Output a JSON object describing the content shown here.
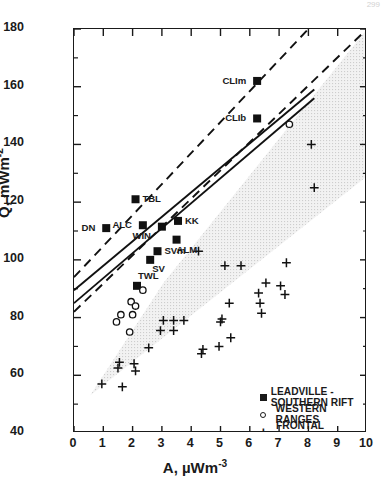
{
  "page": {
    "running_head": "",
    "page_number": "299"
  },
  "chart_data": {
    "type": "scatter",
    "title": "",
    "xlabel": "A, µWm-3",
    "ylabel": "Q, mWm-2",
    "xlabel_base": "A, µWm",
    "xlabel_exp": "-3",
    "ylabel_base": "Q, mWm",
    "ylabel_exp": "-2",
    "xlim": [
      0,
      10
    ],
    "ylim": [
      40,
      180
    ],
    "xticks": [
      0,
      1,
      2,
      3,
      4,
      5,
      6,
      7,
      8,
      9,
      10
    ],
    "yticks": [
      40,
      60,
      80,
      100,
      120,
      140,
      160,
      180
    ],
    "grid": false,
    "legend_position": "lower-right-inside",
    "legend": [
      {
        "marker": "filled-square",
        "label": "LEADVILLE - SOUTHERN RIFT"
      },
      {
        "marker": "open-circle",
        "label": "WESTERN RANGES"
      },
      {
        "marker": "plus",
        "label": "FRONTAL RANGES"
      }
    ],
    "series": [
      {
        "name": "LEADVILLE - SOUTHERN RIFT",
        "marker": "filled-square",
        "points": [
          {
            "x": 1.1,
            "y": 111.0,
            "label": "DN",
            "label_pos": "left"
          },
          {
            "x": 2.1,
            "y": 121.0,
            "label": "TBL",
            "label_pos": "right"
          },
          {
            "x": 2.35,
            "y": 112.0,
            "label": "ALC",
            "label_pos": "left"
          },
          {
            "x": 3.0,
            "y": 111.5,
            "label": "WIN",
            "label_pos": "below-left"
          },
          {
            "x": 3.55,
            "y": 113.5,
            "label": "KK",
            "label_pos": "right"
          },
          {
            "x": 3.5,
            "y": 107.0,
            "label": "ALM",
            "label_pos": "below"
          },
          {
            "x": 2.85,
            "y": 103.0,
            "label": "SVm",
            "label_pos": "right"
          },
          {
            "x": 2.6,
            "y": 100.0,
            "label": "SV",
            "label_pos": "below-right"
          },
          {
            "x": 2.15,
            "y": 91.0,
            "label": "TWL",
            "label_pos": "above-right"
          },
          {
            "x": 6.25,
            "y": 162.0,
            "label": "CLIm",
            "label_pos": "left"
          },
          {
            "x": 6.25,
            "y": 149.0,
            "label": "CLIb",
            "label_pos": "left"
          }
        ]
      },
      {
        "name": "WESTERN RANGES",
        "marker": "open-circle",
        "points": [
          {
            "x": 7.35,
            "y": 147.0
          },
          {
            "x": 2.35,
            "y": 89.5
          },
          {
            "x": 1.95,
            "y": 85.5
          },
          {
            "x": 2.1,
            "y": 84.0
          },
          {
            "x": 2.0,
            "y": 81.0
          },
          {
            "x": 1.6,
            "y": 81.0
          },
          {
            "x": 1.9,
            "y": 75.0
          },
          {
            "x": 1.45,
            "y": 78.5
          }
        ]
      },
      {
        "name": "FRONTAL RANGES",
        "marker": "plus",
        "points": [
          {
            "x": 8.1,
            "y": 140.0
          },
          {
            "x": 8.2,
            "y": 125.0
          },
          {
            "x": 4.25,
            "y": 103.0
          },
          {
            "x": 5.15,
            "y": 98.0
          },
          {
            "x": 5.7,
            "y": 98.0
          },
          {
            "x": 7.25,
            "y": 99.0
          },
          {
            "x": 6.55,
            "y": 92.0
          },
          {
            "x": 7.05,
            "y": 91.0
          },
          {
            "x": 6.3,
            "y": 88.5
          },
          {
            "x": 7.2,
            "y": 88.0
          },
          {
            "x": 5.3,
            "y": 85.0
          },
          {
            "x": 6.35,
            "y": 85.0
          },
          {
            "x": 6.4,
            "y": 81.5
          },
          {
            "x": 5.05,
            "y": 79.5
          },
          {
            "x": 5.0,
            "y": 78.5
          },
          {
            "x": 3.05,
            "y": 79.0
          },
          {
            "x": 3.4,
            "y": 79.0
          },
          {
            "x": 3.75,
            "y": 79.0
          },
          {
            "x": 2.95,
            "y": 75.5
          },
          {
            "x": 3.4,
            "y": 75.5
          },
          {
            "x": 5.35,
            "y": 73.0
          },
          {
            "x": 4.95,
            "y": 70.0
          },
          {
            "x": 2.55,
            "y": 69.5
          },
          {
            "x": 4.4,
            "y": 69.0
          },
          {
            "x": 4.35,
            "y": 67.5
          },
          {
            "x": 1.55,
            "y": 64.5
          },
          {
            "x": 2.05,
            "y": 64.0
          },
          {
            "x": 1.5,
            "y": 62.5
          },
          {
            "x": 2.1,
            "y": 61.5
          },
          {
            "x": 0.95,
            "y": 57.0
          },
          {
            "x": 1.65,
            "y": 56.0
          }
        ]
      }
    ],
    "lines": [
      {
        "name": "upper-envelope",
        "style": "dashed",
        "x0": 0.0,
        "y0": 94.0,
        "x1": 8.0,
        "y1": 180.0
      },
      {
        "name": "lower-envelope",
        "style": "dashed",
        "x0": 0.0,
        "y0": 82.0,
        "x1": 10.0,
        "y1": 180.0
      },
      {
        "name": "regression-a",
        "style": "solid",
        "x0": 0.0,
        "y0": 89.5,
        "x1": 8.2,
        "y1": 159.0
      },
      {
        "name": "regression-b",
        "style": "solid",
        "x0": 0.0,
        "y0": 85.0,
        "x1": 8.2,
        "y1": 156.0
      }
    ],
    "shaded_band": {
      "name": "frontal-ranges-stippled-wedge",
      "fill": "#ececec",
      "vertices": [
        {
          "x": 0.55,
          "y": 53.0
        },
        {
          "x": 10.0,
          "y": 129.0
        },
        {
          "x": 10.0,
          "y": 180.0
        },
        {
          "x": 3.05,
          "y": 92.0
        }
      ]
    }
  }
}
